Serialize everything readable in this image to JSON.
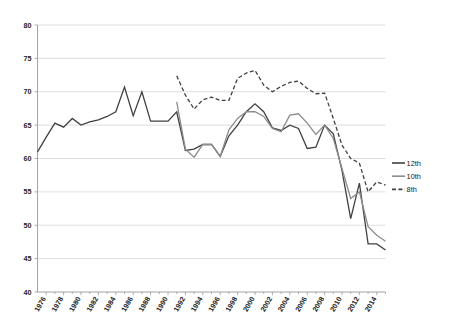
{
  "chart_data": {
    "type": "line",
    "title": "",
    "subtitle": "",
    "xlabel": "",
    "ylabel": "",
    "ylim": [
      40,
      80
    ],
    "ytick_labels": [
      "40",
      "45",
      "50",
      "55",
      "60",
      "65",
      "70",
      "75",
      "80"
    ],
    "yticks": [
      40,
      45,
      50,
      55,
      60,
      65,
      70,
      75,
      80
    ],
    "grid": true,
    "legend_position": "right",
    "xlim": [
      1975,
      2015
    ],
    "x": [
      1975,
      1976,
      1977,
      1978,
      1979,
      1980,
      1981,
      1982,
      1983,
      1984,
      1985,
      1986,
      1987,
      1988,
      1989,
      1990,
      1991,
      1992,
      1993,
      1994,
      1995,
      1996,
      1997,
      1998,
      1999,
      2000,
      2001,
      2002,
      2003,
      2004,
      2005,
      2006,
      2007,
      2008,
      2009,
      2010,
      2011,
      2012,
      2013,
      2014,
      2015
    ],
    "xtick_labels": [
      "1976",
      "1978",
      "1980",
      "1982",
      "1984",
      "1986",
      "1988",
      "1990",
      "1992",
      "1994",
      "1996",
      "1998",
      "2000",
      "2002",
      "2004",
      "2006",
      "2008",
      "2010",
      "2012",
      "2014"
    ],
    "xticks": [
      1976,
      1978,
      1980,
      1982,
      1984,
      1986,
      1988,
      1990,
      1992,
      1994,
      1996,
      1998,
      2000,
      2002,
      2004,
      2006,
      2008,
      2010,
      2012,
      2014
    ],
    "series": [
      {
        "name": "12th",
        "color": "#404040",
        "style": "solid",
        "width": 1.3,
        "x": [
          1975,
          1976,
          1977,
          1978,
          1979,
          1980,
          1981,
          1982,
          1983,
          1984,
          1985,
          1986,
          1987,
          1988,
          1989,
          1990,
          1991,
          1992,
          1993,
          1994,
          1995,
          1996,
          1997,
          1998,
          1999,
          2000,
          2001,
          2002,
          2003,
          2004,
          2005,
          2006,
          2007,
          2008,
          2009,
          2010,
          2011,
          2012,
          2013,
          2014,
          2015
        ],
        "values": [
          61.0,
          63.2,
          65.3,
          64.7,
          66.0,
          65.0,
          65.5,
          65.8,
          66.3,
          67.0,
          70.7,
          66.4,
          70.0,
          65.6,
          65.6,
          65.6,
          67.0,
          61.2,
          61.4,
          62.1,
          62.1,
          60.3,
          63.4,
          65.0,
          67.0,
          68.2,
          67.0,
          64.6,
          64.2,
          65.0,
          64.5,
          61.5,
          61.7,
          65.0,
          63.7,
          58.2,
          51.0,
          56.3,
          47.2,
          47.2,
          46.3
        ]
      },
      {
        "name": "10th",
        "color": "#8d8d8d",
        "style": "solid",
        "width": 1.3,
        "x": [
          1991,
          1992,
          1993,
          1994,
          1995,
          1996,
          1997,
          1998,
          1999,
          2000,
          2001,
          2002,
          2003,
          2004,
          2005,
          2006,
          2007,
          2008,
          2009,
          2010,
          2011,
          2012,
          2013,
          2014,
          2015
        ],
        "values": [
          68.5,
          61.4,
          60.2,
          62.1,
          62.1,
          60.3,
          64.3,
          66.0,
          67.0,
          67.0,
          66.3,
          64.5,
          64.0,
          66.5,
          66.7,
          65.3,
          63.6,
          65.0,
          63.0,
          58.5,
          54.0,
          55.0,
          49.8,
          48.5,
          47.6
        ]
      },
      {
        "name": "8th",
        "color": "#404040",
        "style": "dashed",
        "width": 1.3,
        "x": [
          1991,
          1992,
          1993,
          1994,
          1995,
          1996,
          1997,
          1998,
          1999,
          2000,
          2001,
          2002,
          2003,
          2004,
          2005,
          2006,
          2007,
          2008,
          2009,
          2010,
          2011,
          2012,
          2013,
          2014,
          2015
        ],
        "values": [
          72.4,
          69.5,
          67.4,
          68.8,
          69.2,
          68.7,
          68.7,
          72.0,
          72.8,
          73.2,
          71.0,
          70.0,
          70.8,
          71.4,
          71.6,
          70.5,
          69.7,
          69.8,
          66.0,
          62.0,
          60.0,
          59.3,
          55.0,
          56.5,
          56.0
        ]
      }
    ]
  },
  "legend": {
    "items": [
      {
        "label": "12th"
      },
      {
        "label": "10th"
      },
      {
        "label": "8th"
      }
    ]
  },
  "colors": {
    "grade12": "#404040",
    "grade10": "#8d8d8d",
    "grade8": "#404040",
    "gridline": "#d6d6d6",
    "axis": "#9a9a9a",
    "text": "#222222",
    "background": "#ffffff"
  }
}
